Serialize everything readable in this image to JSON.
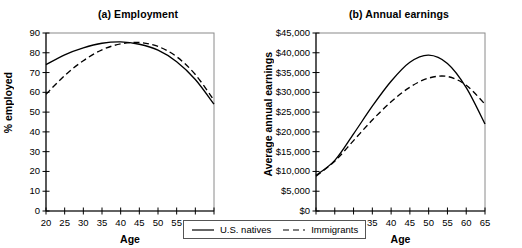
{
  "figure": {
    "legend": {
      "entries": [
        {
          "label": "U.S. natives",
          "style": "solid",
          "icon": "solid-line-swatch-icon"
        },
        {
          "label": "Immigrants",
          "style": "dashed",
          "icon": "dashed-line-swatch-icon"
        }
      ]
    }
  },
  "chart_data": [
    {
      "type": "line",
      "panel": "a",
      "title": "(a) Employment",
      "xlabel": "Age",
      "ylabel": "% employed",
      "xlim": [
        20,
        65
      ],
      "ylim": [
        0,
        90
      ],
      "xticks": [
        20,
        25,
        30,
        35,
        40,
        45,
        50,
        55,
        60,
        65
      ],
      "xtick_labels": [
        "20",
        "25",
        "30",
        "35",
        "40",
        "45",
        "50",
        "55",
        "60",
        "65"
      ],
      "yticks": [
        0,
        10,
        20,
        30,
        40,
        50,
        60,
        70,
        80,
        90
      ],
      "ytick_labels": [
        "0",
        "10",
        "20",
        "30",
        "40",
        "50",
        "60",
        "70",
        "80",
        "90"
      ],
      "grid": false,
      "legend_position": "below-figure-center",
      "x": [
        20,
        25,
        30,
        35,
        40,
        45,
        50,
        55,
        60,
        65
      ],
      "series": [
        {
          "name": "U.S. natives",
          "style": "solid",
          "values": [
            74.0,
            79.0,
            82.5,
            84.8,
            85.5,
            84.3,
            81.3,
            75.5,
            66.5,
            54.0
          ]
        },
        {
          "name": "Immigrants",
          "style": "dashed",
          "values": [
            59.0,
            68.5,
            76.0,
            81.5,
            84.5,
            85.2,
            83.2,
            78.0,
            69.0,
            56.0
          ]
        }
      ]
    },
    {
      "type": "line",
      "panel": "b",
      "title": "(b) Annual earnings",
      "xlabel": "Age",
      "ylabel": "Average annual earnings",
      "xlim": [
        20,
        65
      ],
      "ylim": [
        0,
        45000
      ],
      "xticks": [
        20,
        25,
        30,
        35,
        40,
        45,
        50,
        55,
        60,
        65
      ],
      "xtick_labels": [
        "20",
        "25",
        "30",
        "35",
        "40",
        "45",
        "50",
        "55",
        "60",
        "65"
      ],
      "yticks": [
        0,
        5000,
        10000,
        15000,
        20000,
        25000,
        30000,
        35000,
        40000,
        45000
      ],
      "ytick_labels": [
        "$0",
        "$5,000",
        "$10,000",
        "$15,000",
        "$20,000",
        "$25,000",
        "$30,000",
        "$35,000",
        "$40,000",
        "$45,000"
      ],
      "grid": false,
      "legend_position": "below-figure-center",
      "x": [
        20,
        25,
        30,
        35,
        40,
        45,
        50,
        55,
        60,
        65
      ],
      "series": [
        {
          "name": "U.S. natives",
          "style": "solid",
          "values": [
            9000,
            12800,
            19500,
            26500,
            32800,
            37600,
            39400,
            37300,
            31200,
            22000
          ]
        },
        {
          "name": "Immigrants",
          "style": "dashed",
          "values": [
            8800,
            12600,
            17800,
            23000,
            27600,
            31300,
            33600,
            34000,
            31800,
            27000
          ]
        }
      ]
    }
  ]
}
